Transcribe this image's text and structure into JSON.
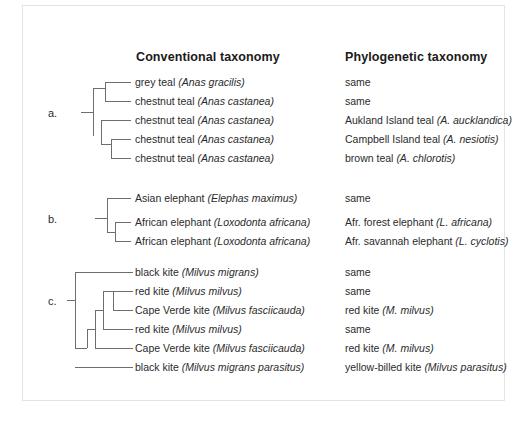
{
  "figure": {
    "headers": {
      "conventional": "Conventional taxonomy",
      "phylogenetic": "Phylogenetic taxonomy"
    },
    "groups": [
      {
        "id": "a",
        "label": "a.",
        "rows": [
          {
            "common": "grey teal ",
            "scientific": "(Anas gracilis)",
            "phylo_common": "same",
            "phylo_scientific": ""
          },
          {
            "common": "chestnut teal ",
            "scientific": "(Anas castanea)",
            "phylo_common": "same",
            "phylo_scientific": ""
          },
          {
            "common": "chestnut teal ",
            "scientific": "(Anas castanea)",
            "phylo_common": "Aukland Island teal ",
            "phylo_scientific": "(A. aucklandica)"
          },
          {
            "common": "chestnut teal ",
            "scientific": "(Anas castanea)",
            "phylo_common": "Campbell Island teal ",
            "phylo_scientific": "(A. nesiotis)"
          },
          {
            "common": "chestnut teal ",
            "scientific": "(Anas castanea)",
            "phylo_common": "brown teal ",
            "phylo_scientific": "(A. chlorotis)"
          }
        ]
      },
      {
        "id": "b",
        "label": "b.",
        "rows": [
          {
            "common": "Asian elephant ",
            "scientific": "(Elephas maximus)",
            "phylo_common": "same",
            "phylo_scientific": ""
          },
          {
            "common": "African elephant ",
            "scientific": "(Loxodonta africana)",
            "phylo_common": "Afr. forest elephant ",
            "phylo_scientific": "(L. africana)"
          },
          {
            "common": "African elephant ",
            "scientific": "(Loxodonta africana)",
            "phylo_common": "Afr. savannah elephant ",
            "phylo_scientific": "(L. cyclotis)"
          }
        ]
      },
      {
        "id": "c",
        "label": "c.",
        "rows": [
          {
            "common": "black kite ",
            "scientific": "(Milvus migrans)",
            "phylo_common": "same",
            "phylo_scientific": ""
          },
          {
            "common": "red kite ",
            "scientific": "(Milvus milvus)",
            "phylo_common": "same",
            "phylo_scientific": ""
          },
          {
            "common": "Cape Verde kite ",
            "scientific": "(Milvus fasciicauda)",
            "phylo_common": "red kite ",
            "phylo_scientific": "(M. milvus)"
          },
          {
            "common": "red kite ",
            "scientific": "(Milvus milvus)",
            "phylo_common": "same",
            "phylo_scientific": ""
          },
          {
            "common": "Cape Verde kite ",
            "scientific": "(Milvus fasciicauda)",
            "phylo_common": "red kite ",
            "phylo_scientific": "(M. milvus)"
          },
          {
            "common": "black kite ",
            "scientific": "(Milvus migrans parasitus)",
            "phylo_common": "yellow-billed kite ",
            "phylo_scientific": "(Milvus parasitus)"
          }
        ]
      }
    ],
    "colors": {
      "branch": "#6e6e6e",
      "text": "#2b2b2b",
      "header_text": "#1a1a1a",
      "frame": "#e3e3e3",
      "background": "#ffffff"
    }
  }
}
